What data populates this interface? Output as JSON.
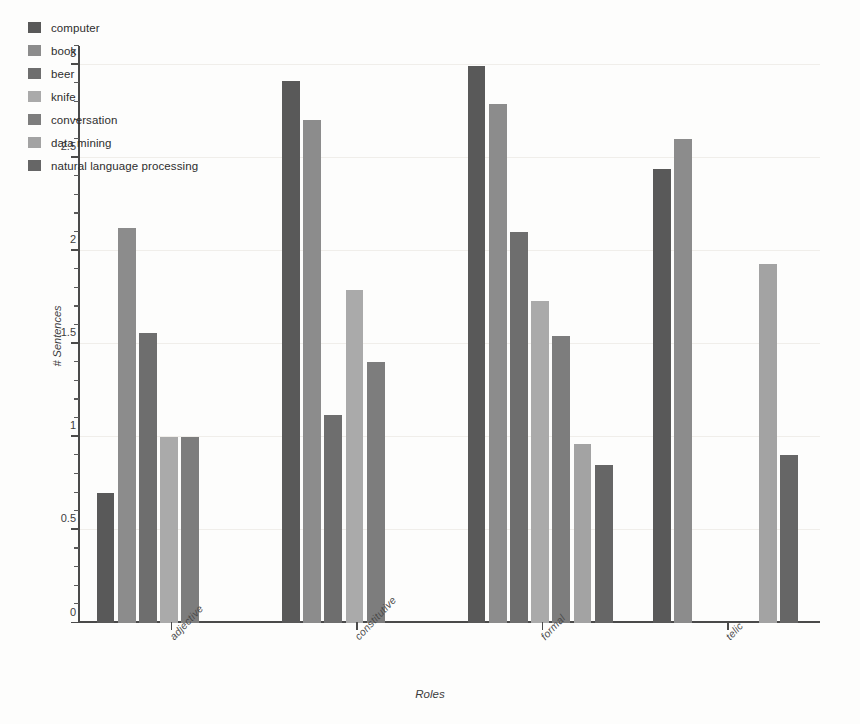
{
  "chart_data": {
    "type": "bar",
    "title": "",
    "xlabel": "Roles",
    "ylabel": "# Sentences",
    "ylim": [
      0,
      3.1
    ],
    "yticks": [
      0,
      0.5,
      1,
      1.5,
      2,
      2.5,
      3
    ],
    "ytick_labels": [
      "0",
      "0.5",
      "1",
      "1.5",
      "2",
      "2.5",
      "3"
    ],
    "minor_tick_step": 0.1,
    "grid": true,
    "legend_position": "upper-left",
    "categories": [
      "adjective",
      "constitutive",
      "formal",
      "telic"
    ],
    "series": [
      {
        "name": "computer",
        "color": "#595959",
        "values": [
          0.7,
          2.91,
          2.99,
          2.44
        ]
      },
      {
        "name": "book",
        "color": "#8c8c8c",
        "values": [
          2.12,
          2.7,
          2.79,
          2.6
        ]
      },
      {
        "name": "beer",
        "color": "#6e6e6e",
        "values": [
          1.56,
          1.12,
          2.1,
          null
        ]
      },
      {
        "name": "knife",
        "color": "#aaaaaa",
        "values": [
          1.0,
          1.79,
          1.73,
          null
        ]
      },
      {
        "name": "conversation",
        "color": "#7d7d7d",
        "values": [
          1.0,
          1.4,
          1.54,
          null
        ]
      },
      {
        "name": "data mining",
        "color": "#a3a3a3",
        "values": [
          null,
          null,
          0.96,
          1.93
        ]
      },
      {
        "name": "natural language processing",
        "color": "#666666",
        "values": [
          null,
          null,
          0.85,
          0.9
        ]
      }
    ]
  },
  "legend": {
    "items": [
      {
        "label": "computer"
      },
      {
        "label": "book"
      },
      {
        "label": "beer"
      },
      {
        "label": "knife"
      },
      {
        "label": "conversation"
      },
      {
        "label": "data mining"
      },
      {
        "label": "natural language processing"
      }
    ]
  },
  "axes": {
    "y_title": "# Sentences",
    "x_title": "Roles"
  }
}
